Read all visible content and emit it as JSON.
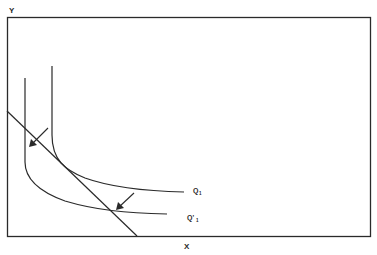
{
  "diagram": {
    "y_axis_label": "Y",
    "x_axis_label": "X",
    "curves": [
      {
        "name": "Q1",
        "label": "Q",
        "subscript": "1"
      },
      {
        "name": "Q'1",
        "label": "Q'",
        "subscript": "1"
      }
    ],
    "elements": {
      "budget_line": "straight line tangent to Q1 and shifted curve Q'1",
      "arrows": 2
    },
    "colors": {
      "stroke": "#2a2a2a",
      "background": "#ffffff"
    }
  }
}
